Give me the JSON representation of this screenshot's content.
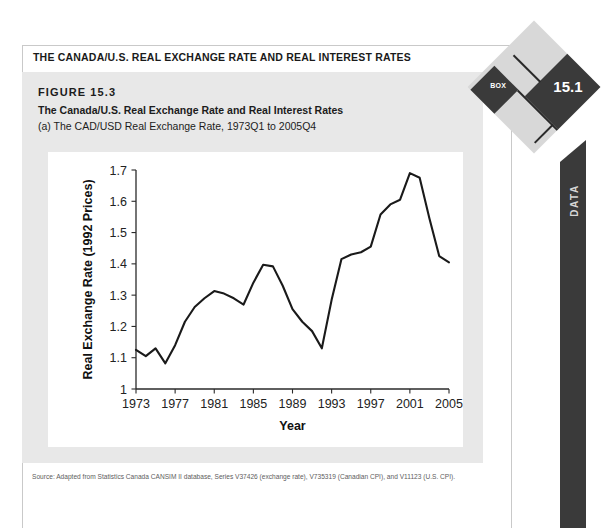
{
  "box": {
    "header_title": "THE CANADA/U.S. REAL EXCHANGE RATE AND REAL INTEREST RATES",
    "badge_label": "BOX",
    "badge_number": "15.1",
    "side_tab_label": "DATA"
  },
  "figure": {
    "number": "FIGURE 15.3",
    "title": "The Canada/U.S. Real Exchange Rate and Real Interest Rates",
    "subtitle": "(a) The CAD/USD Real Exchange Rate, 1973Q1 to 2005Q4"
  },
  "source": "Source: Adapted from Statistics Canada CANSIM II database, Series V37426 (exchange rate), V735319 (Canadian CPI), and V11123 (U.S. CPI).",
  "chart_data": {
    "type": "line",
    "title": "",
    "xlabel": "Year",
    "ylabel": "Real Exchange Rate (1992 Prices)",
    "xlim": [
      1973,
      2005
    ],
    "ylim": [
      1,
      1.7
    ],
    "xticks": [
      1973,
      1977,
      1981,
      1985,
      1989,
      1993,
      1997,
      2001,
      2005
    ],
    "xtick_labels": [
      "1973",
      "1977",
      "1981",
      "1985",
      "1989",
      "1993",
      "1997",
      "2001",
      "2005"
    ],
    "yticks": [
      1,
      1.1,
      1.2,
      1.3,
      1.4,
      1.5,
      1.6,
      1.7
    ],
    "ytick_labels": [
      "1",
      "1.1",
      "1.2",
      "1.3",
      "1.4",
      "1.5",
      "1.6",
      "1.7"
    ],
    "grid": false,
    "legend": false,
    "line_color": "#1a1a1a",
    "series": [
      {
        "name": "CAD/USD Real Exchange Rate",
        "x": [
          1973,
          1974,
          1975,
          1976,
          1977,
          1978,
          1979,
          1980,
          1981,
          1982,
          1983,
          1984,
          1985,
          1986,
          1987,
          1988,
          1989,
          1990,
          1991,
          1992,
          1993,
          1994,
          1995,
          1996,
          1997,
          1998,
          1999,
          2000,
          2001,
          2002,
          2003,
          2004,
          2005
        ],
        "values": [
          1.125,
          1.105,
          1.13,
          1.082,
          1.14,
          1.215,
          1.262,
          1.29,
          1.313,
          1.305,
          1.29,
          1.27,
          1.34,
          1.397,
          1.392,
          1.33,
          1.255,
          1.215,
          1.185,
          1.13,
          1.285,
          1.415,
          1.43,
          1.437,
          1.455,
          1.558,
          1.59,
          1.605,
          1.69,
          1.675,
          1.545,
          1.425,
          1.405
        ]
      }
    ]
  }
}
